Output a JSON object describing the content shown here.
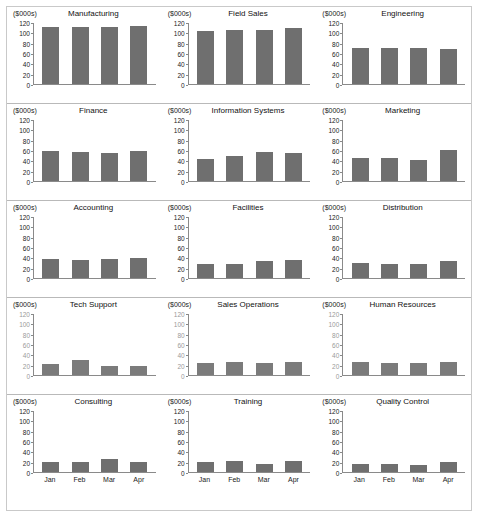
{
  "units_label": "($000s)",
  "axis": {
    "yticks": [
      0,
      20,
      40,
      60,
      80,
      100,
      120
    ],
    "ymax": 120,
    "categories": [
      "Jan",
      "Feb",
      "Mar",
      "Apr"
    ]
  },
  "colors": {
    "bar": "#6f6f6f",
    "axis": "#8a8a8a",
    "panel_border": "#b9b9b9",
    "frame": "#c9c9c9",
    "background": "#ffffff"
  },
  "chart_data": {
    "type": "bar",
    "xlabel": "",
    "ylabel": "($000s)",
    "ylim": [
      0,
      120
    ],
    "grid": false,
    "legend": "none",
    "categories": [
      "Jan",
      "Feb",
      "Mar",
      "Apr"
    ],
    "panels": [
      {
        "title": "Manufacturing",
        "values": [
          110,
          111,
          110,
          112
        ]
      },
      {
        "title": "Field Sales",
        "values": [
          103,
          105,
          104,
          109
        ]
      },
      {
        "title": "Engineering",
        "values": [
          69,
          70,
          70,
          67
        ]
      },
      {
        "title": "Finance",
        "values": [
          58,
          56,
          54,
          59
        ]
      },
      {
        "title": "Information Systems",
        "values": [
          43,
          49,
          57,
          54
        ]
      },
      {
        "title": "Marketing",
        "values": [
          45,
          44,
          40,
          60
        ]
      },
      {
        "title": "Accounting",
        "values": [
          37,
          35,
          36,
          39
        ]
      },
      {
        "title": "Facilities",
        "values": [
          27,
          28,
          32,
          35
        ]
      },
      {
        "title": "Distribution",
        "values": [
          30,
          28,
          28,
          32
        ]
      },
      {
        "title": "Tech Support",
        "values": [
          22,
          30,
          18,
          18
        ]
      },
      {
        "title": "Sales Operations",
        "values": [
          24,
          25,
          23,
          26
        ]
      },
      {
        "title": "Human Resources",
        "values": [
          25,
          24,
          24,
          26
        ]
      },
      {
        "title": "Consulting",
        "values": [
          19,
          20,
          25,
          19
        ]
      },
      {
        "title": "Training",
        "values": [
          19,
          21,
          16,
          22
        ]
      },
      {
        "title": "Quality Control",
        "values": [
          15,
          15,
          13,
          19
        ]
      }
    ]
  },
  "rows": [
    {
      "panels": [
        0,
        1,
        2
      ],
      "show_xlabels": false,
      "noisy": false
    },
    {
      "panels": [
        3,
        4,
        5
      ],
      "show_xlabels": false,
      "noisy": false
    },
    {
      "panels": [
        6,
        7,
        8
      ],
      "show_xlabels": false,
      "noisy": false
    },
    {
      "panels": [
        9,
        10,
        11
      ],
      "show_xlabels": false,
      "noisy": true
    },
    {
      "panels": [
        12,
        13,
        14
      ],
      "show_xlabels": true,
      "noisy": false
    }
  ]
}
